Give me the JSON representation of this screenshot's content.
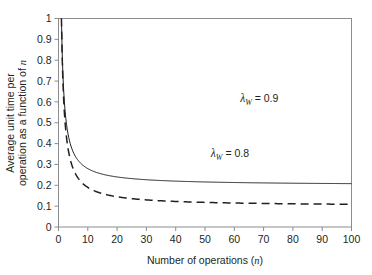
{
  "chart_data": {
    "type": "line",
    "title": "",
    "xlabel": "Number of operations (n)",
    "xlabel_main": "Number of operations (",
    "xlabel_italic": "n",
    "xlabel_close": ")",
    "ylabel": "Average unit time per operation as a function of n",
    "ylabel_line1": "Average unit time per",
    "ylabel_line2_main": "operation as a function of ",
    "ylabel_line2_italic": "n",
    "xlim": [
      0,
      100
    ],
    "ylim": [
      0,
      1
    ],
    "xticks": [
      0,
      10,
      20,
      30,
      40,
      50,
      60,
      70,
      80,
      90,
      100
    ],
    "xtick_labels": [
      "0",
      "10",
      "20",
      "30",
      "40",
      "50",
      "60",
      "70",
      "80",
      "90",
      "100"
    ],
    "yticks": [
      0,
      0.1,
      0.2,
      0.3,
      0.4,
      0.5,
      0.6,
      0.7,
      0.8,
      0.9,
      1
    ],
    "ytick_labels": [
      "0",
      "0.1",
      "0.2",
      "0.3",
      "0.4",
      "0.5",
      "0.6",
      "0.7",
      "0.8",
      "0.9",
      "1"
    ],
    "grid": false,
    "legend_position": "inline-annotations",
    "series": [
      {
        "name": "lambda_W = 0.9",
        "label_lambda": "λ",
        "label_sub": "W",
        "label_value": " = 0.9",
        "style": "dashed",
        "color": "#231f20",
        "lambda": 0.9,
        "formula": "0.1 + 0.9/n",
        "annotation_x": 62,
        "annotation_y": 0.6,
        "x": [
          1,
          2,
          3,
          4,
          5,
          6,
          7,
          8,
          9,
          10,
          12,
          14,
          16,
          18,
          20,
          25,
          30,
          35,
          40,
          45,
          50,
          55,
          60,
          65,
          70,
          75,
          80,
          85,
          90,
          95,
          100
        ],
        "values": [
          1.0,
          0.55,
          0.4,
          0.325,
          0.28,
          0.25,
          0.229,
          0.213,
          0.2,
          0.19,
          0.175,
          0.164,
          0.156,
          0.15,
          0.145,
          0.136,
          0.13,
          0.126,
          0.123,
          0.12,
          0.118,
          0.116,
          0.115,
          0.114,
          0.113,
          0.112,
          0.111,
          0.111,
          0.11,
          0.109,
          0.109
        ],
        "endpoint_value": 0.509
      },
      {
        "name": "lambda_W = 0.8",
        "label_lambda": "λ",
        "label_sub": "W",
        "label_value": " = 0.8",
        "style": "solid",
        "color": "#231f20",
        "lambda": 0.8,
        "formula": "0.2 + 0.8/n",
        "annotation_x": 52,
        "annotation_y": 0.335,
        "x": [
          1,
          2,
          3,
          4,
          5,
          6,
          7,
          8,
          9,
          10,
          12,
          14,
          16,
          18,
          20,
          25,
          30,
          35,
          40,
          45,
          50,
          55,
          60,
          65,
          70,
          75,
          80,
          85,
          90,
          95,
          100
        ],
        "values": [
          1.0,
          0.6,
          0.467,
          0.4,
          0.36,
          0.333,
          0.314,
          0.3,
          0.289,
          0.28,
          0.267,
          0.257,
          0.25,
          0.244,
          0.24,
          0.232,
          0.227,
          0.223,
          0.22,
          0.218,
          0.216,
          0.215,
          0.213,
          0.212,
          0.211,
          0.211,
          0.21,
          0.209,
          0.209,
          0.208,
          0.208
        ],
        "endpoint_value": 0.208
      }
    ]
  },
  "figure": {
    "axis_color": "#808285",
    "curve_color": "#231f20",
    "background": "#ffffff"
  }
}
